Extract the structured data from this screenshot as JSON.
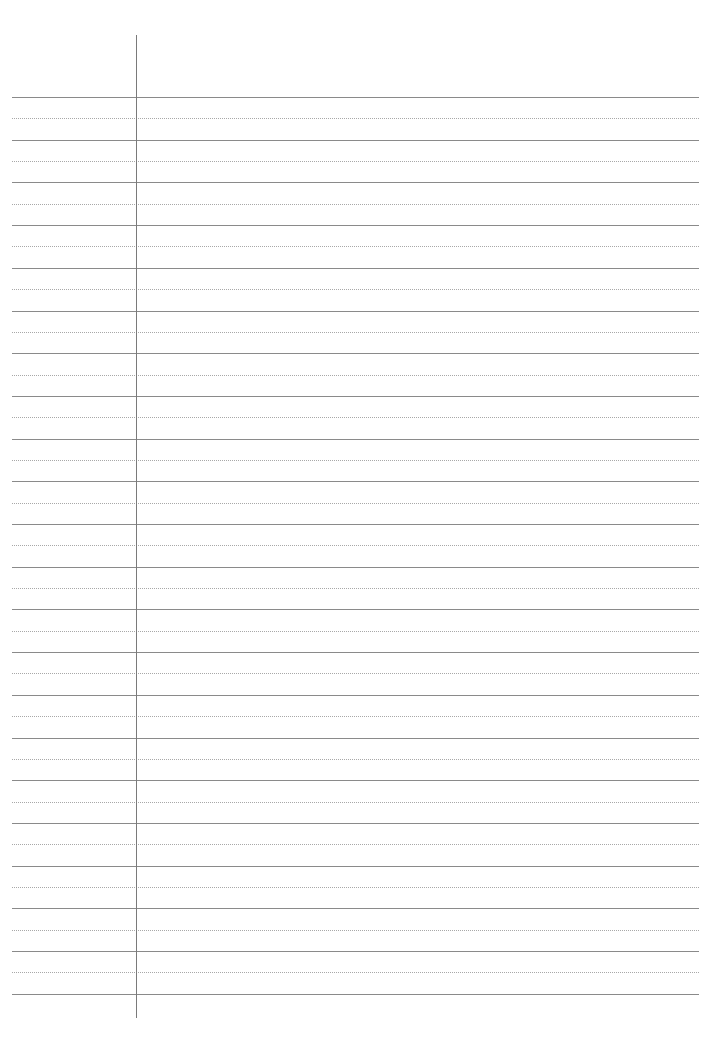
{
  "page": {
    "type": "ruled-notebook-paper",
    "background_color": "#ffffff",
    "width": 719,
    "height": 1052
  },
  "rules": {
    "left": 12,
    "right": 699,
    "first_solid_y": 97,
    "spacing": 42.7,
    "solid_count": 22,
    "dotted_between": true,
    "solid_color": "#8a8a8a",
    "dotted_color": "#a8a8a8"
  },
  "margin_line": {
    "x": 136,
    "top": 35,
    "bottom": 1018,
    "color": "#7a7a7a"
  }
}
